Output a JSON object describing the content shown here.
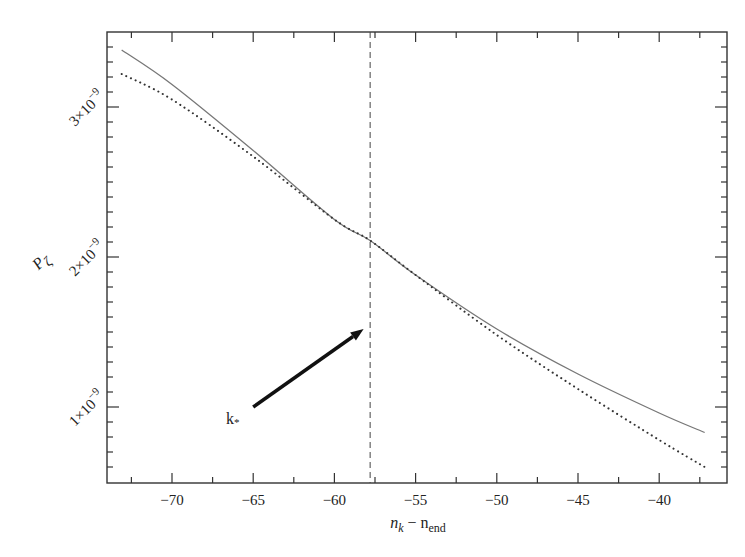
{
  "chart_data": {
    "type": "line",
    "title": "",
    "xlabel": "n_k − n_end",
    "ylabel": "P_ζ",
    "xlim": [
      -74,
      -36
    ],
    "ylim": [
      5e-10,
      3.5e-09
    ],
    "grid": false,
    "legend": null,
    "x_ticks": [
      -70,
      -65,
      -60,
      -55,
      -50,
      -45,
      -40
    ],
    "x_tick_labels": [
      "−70",
      "−65",
      "−60",
      "−55",
      "−50",
      "−45",
      "−40"
    ],
    "y_ticks": [
      1e-09,
      2e-09,
      3e-09
    ],
    "y_tick_labels": [
      "1×10⁻⁹",
      "2×10⁻⁹",
      "3×10⁻⁹"
    ],
    "series": [
      {
        "name": "P_zeta (exact)",
        "style": "solid",
        "color": "#777777",
        "x": [
          -73.1,
          -70,
          -65,
          -60,
          -57.8,
          -55,
          -50,
          -45,
          -40,
          -37.2
        ],
        "y": [
          3.38e-09,
          3.15e-09,
          2.71e-09,
          2.25e-09,
          2.11e-09,
          1.88e-09,
          1.52e-09,
          1.22e-09,
          9.6e-10,
          8.3e-10
        ]
      },
      {
        "name": "P_zeta (approximation)",
        "style": "dotted",
        "color": "#333333",
        "x": [
          -73.1,
          -70,
          -65,
          -60,
          -57.8,
          -55,
          -50,
          -45,
          -40,
          -37.2
        ],
        "y": [
          3.22e-09,
          3.05e-09,
          2.67e-09,
          2.25e-09,
          2.11e-09,
          1.88e-09,
          1.48e-09,
          1.12e-09,
          7.8e-10,
          6e-10
        ]
      }
    ],
    "annotations": [
      {
        "type": "vline",
        "x": -57.8,
        "style": "dashed",
        "label": ""
      },
      {
        "type": "arrow",
        "text": "k*",
        "text_at": [
          -66.5,
          9e-10
        ],
        "from": [
          -65,
          1e-09
        ],
        "to": [
          -58.2,
          1.52e-09
        ]
      }
    ]
  },
  "labels": {
    "xlabel_main": "n",
    "xlabel_sub1": "k",
    "xlabel_minus": " − n",
    "xlabel_sub2": "end",
    "ylabel_main": "P",
    "ylabel_sub": "ζ",
    "y_tick_1": "1×10",
    "y_tick_2": "2×10",
    "y_tick_3": "3×10",
    "y_tick_exp": "−9",
    "annotation": "k",
    "annotation_sub": "*"
  }
}
